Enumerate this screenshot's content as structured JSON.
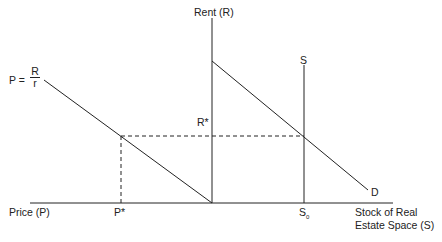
{
  "diagram": {
    "labels": {
      "rent_axis": "Rent (R)",
      "price_axis": "Price (P)",
      "stock_axis_line1": "Stock of Real",
      "stock_axis_line2": "Estate Space (S)",
      "supply": "S",
      "demand": "D",
      "r_star": "R*",
      "p_star": "P*",
      "s_zero": "S",
      "s_zero_sub": "0",
      "price_eq_lhs": "P =",
      "price_eq_num": "R",
      "price_eq_den": "r"
    },
    "colors": {
      "line": "#222222",
      "background": "#ffffff"
    }
  }
}
